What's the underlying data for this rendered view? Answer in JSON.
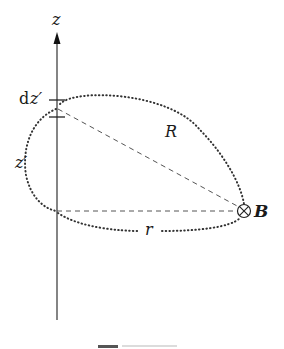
{
  "diagram": {
    "axis_label": "z",
    "element_label_d": "d",
    "element_label_var": "z′",
    "source_height_label": "z′",
    "distance_label": "R",
    "radius_label": "r",
    "field_label": "B",
    "field_symbol": "⊗",
    "colors": {
      "line": "#333333",
      "dotted": "#333333",
      "dashed": "#555555",
      "background": "#ffffff"
    }
  }
}
